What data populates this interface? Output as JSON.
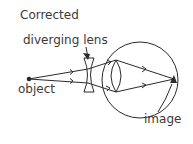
{
  "labels": {
    "title": "Corrected",
    "lens": "diverging lens",
    "object": "object",
    "image": "image"
  },
  "colors": {
    "line": "#2a2a2a",
    "text": "#3a3a3a",
    "background": "#ffffff"
  }
}
